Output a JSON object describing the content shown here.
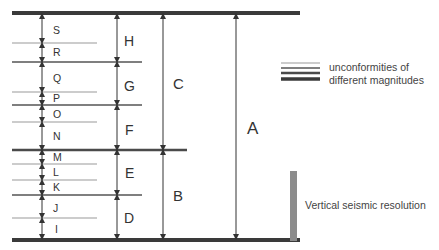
{
  "diagram": {
    "type": "stratigraphic-hierarchy",
    "colors": {
      "major_line": "#3a3a3a",
      "medium_line": "#555555",
      "minor_line": "#9a9a9a",
      "arrow": "#333333",
      "label": "#333333",
      "resolution_bar": "#8c8c8c"
    },
    "small_units": [
      {
        "label": "S"
      },
      {
        "label": "R"
      },
      {
        "label": "Q"
      },
      {
        "label": "P"
      },
      {
        "label": "O"
      },
      {
        "label": "N"
      },
      {
        "label": "M"
      },
      {
        "label": "L"
      },
      {
        "label": "K"
      },
      {
        "label": "J"
      },
      {
        "label": "I"
      }
    ],
    "medium_units": [
      {
        "label": "H"
      },
      {
        "label": "G"
      },
      {
        "label": "F"
      },
      {
        "label": "E"
      },
      {
        "label": "D"
      }
    ],
    "large_units": [
      {
        "label": "C"
      },
      {
        "label": "B"
      }
    ],
    "total_unit": {
      "label": "A"
    }
  },
  "legend": {
    "unconformities": {
      "line1": "unconformities of",
      "line2": "different magnitudes"
    },
    "resolution": {
      "label": "Vertical seismic resolution"
    }
  }
}
